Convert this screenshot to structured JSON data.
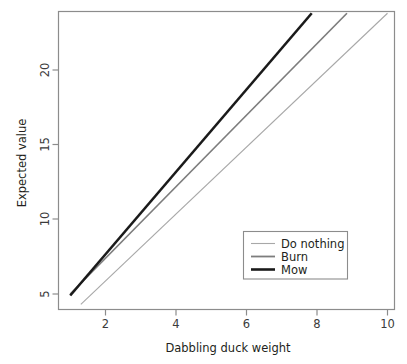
{
  "chart_data": {
    "type": "line",
    "title": "",
    "xlabel": "Dabbling duck weight",
    "ylabel": "Expected value",
    "xlim": [
      0.55,
      10.5
    ],
    "ylim": [
      4.0,
      24.1
    ],
    "xticks": [
      2,
      4,
      6,
      8,
      10
    ],
    "xticklabels": [
      "2",
      "4",
      "6",
      "8",
      "10"
    ],
    "yticks": [
      5,
      10,
      15,
      20
    ],
    "yticklabels": [
      "5",
      "10",
      "15",
      "20"
    ],
    "grid": false,
    "legend_position": "bottom-right",
    "series": [
      {
        "name": "Do nothing",
        "color": "#a8a8a8",
        "linewidth": 1.1,
        "x": [
          1.3,
          10.0
        ],
        "y": [
          4.3,
          23.8
        ],
        "slope": 2.24,
        "intercept": 1.39
      },
      {
        "name": "Burn",
        "color": "#7d7d7d",
        "linewidth": 1.7,
        "x": [
          1.0,
          8.85
        ],
        "y": [
          5.0,
          23.8
        ],
        "slope": 2.39,
        "intercept": 2.61
      },
      {
        "name": "Mow",
        "color": "#1a1a1a",
        "linewidth": 2.6,
        "x": [
          1.0,
          7.85
        ],
        "y": [
          4.9,
          23.8
        ],
        "slope": 2.76,
        "intercept": 2.14
      }
    ]
  },
  "legend": {
    "entries": [
      {
        "label": "Do nothing"
      },
      {
        "label": "Burn"
      },
      {
        "label": "Mow"
      }
    ]
  },
  "axes": {
    "x_title": "Dabbling duck weight",
    "y_title": "Expected value",
    "x_tick_0": "2",
    "x_tick_1": "4",
    "x_tick_2": "6",
    "x_tick_3": "8",
    "x_tick_4": "10",
    "y_tick_0": "5",
    "y_tick_1": "10",
    "y_tick_2": "15",
    "y_tick_3": "20"
  },
  "colors": {
    "frame": "#8c8c8c",
    "do_nothing": "#a8a8a8",
    "burn": "#7d7d7d",
    "mow": "#1a1a1a",
    "background": "#ffffff"
  }
}
